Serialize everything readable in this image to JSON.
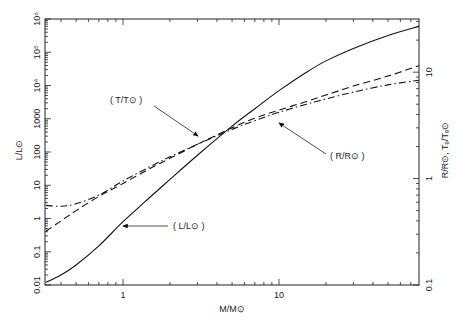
{
  "chart_data": {
    "type": "line",
    "title": "",
    "xlabel": "M/M⊙",
    "ylabel": "L/L⊙",
    "ylabel_right": "R/R⊙, Tₑ/Tₑ⊙",
    "xscale": "log",
    "yscale": "log",
    "y2scale": "log",
    "xlim": [
      0.316,
      79
    ],
    "ylim": [
      0.01,
      1000000
    ],
    "y2lim": [
      0.1,
      31.6
    ],
    "grid": false,
    "legend": "none (inline arrow annotations)",
    "x_ticks": [
      {
        "value": 1,
        "label": "1"
      },
      {
        "value": 10,
        "label": "10"
      }
    ],
    "y_ticks": [
      {
        "value": 0.01,
        "label": "0.01"
      },
      {
        "value": 0.1,
        "label": "0.1"
      },
      {
        "value": 1,
        "label": "1"
      },
      {
        "value": 10,
        "label": "10"
      },
      {
        "value": 100,
        "label": "100"
      },
      {
        "value": 1000,
        "label": "1000"
      },
      {
        "value": 10000,
        "label": "10⁴"
      },
      {
        "value": 100000,
        "label": "10⁵"
      },
      {
        "value": 1000000,
        "label": "10⁶"
      }
    ],
    "y2_ticks": [
      {
        "value": 0.1,
        "label": "0.1"
      },
      {
        "value": 1,
        "label": "1"
      },
      {
        "value": 10,
        "label": "10"
      }
    ],
    "x": [
      0.32,
      0.4,
      0.5,
      0.7,
      1.0,
      1.5,
      2,
      3,
      5,
      7,
      10,
      15,
      20,
      30,
      50,
      79
    ],
    "series": [
      {
        "name": "L/L⊙",
        "axis": "left",
        "style": "solid",
        "values": [
          0.012,
          0.02,
          0.04,
          0.15,
          0.8,
          4.5,
          15,
          80,
          600,
          2000,
          7000,
          25000,
          55000,
          130000,
          320000,
          600000
        ]
      },
      {
        "name": "R/R⊙",
        "axis": "right",
        "style": "dashed",
        "values": [
          0.32,
          0.4,
          0.5,
          0.68,
          0.9,
          1.25,
          1.55,
          2.1,
          3.0,
          3.7,
          4.4,
          5.3,
          6.1,
          7.4,
          9.2,
          11.5
        ]
      },
      {
        "name": "T/T⊙",
        "axis": "right",
        "style": "dash-dot",
        "values": [
          0.56,
          0.55,
          0.58,
          0.7,
          0.95,
          1.3,
          1.6,
          2.1,
          2.9,
          3.5,
          4.2,
          5.0,
          5.6,
          6.5,
          7.6,
          8.4
        ]
      }
    ],
    "annotations": [
      {
        "text": "( T/T⊙ )",
        "points_to": "T/T⊙ curve near M≈3"
      },
      {
        "text": "( R/R⊙ )",
        "points_to": "R/R⊙ curve near M≈6"
      },
      {
        "text": "( L/L⊙ )",
        "points_to": "L/L⊙ curve near M≈1"
      }
    ]
  },
  "labels": {
    "xlabel": "M/M⊙",
    "ylabel": "L/L⊙",
    "ylabel_right": "R/R⊙, Tₑ/Tₑ⊙",
    "annot_T": "( T/T⊙ )",
    "annot_R": "( R/R⊙ )",
    "annot_L": "( L/L⊙ )"
  }
}
